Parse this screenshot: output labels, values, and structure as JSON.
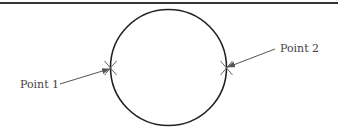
{
  "diagram": {
    "colors": {
      "rule": "#333333",
      "circle": "#222222",
      "arrow": "#555555",
      "cross": "#666666",
      "label": "#444444"
    },
    "circle": {
      "cx": 168.5,
      "cy": 67.5,
      "r": 58
    },
    "points": [
      {
        "label": "Point 1",
        "x": 110.5,
        "y": 68,
        "label_x": 20,
        "label_y": 88
      },
      {
        "label": "Point 2",
        "x": 226.5,
        "y": 68,
        "label_x": 280,
        "label_y": 52
      }
    ]
  }
}
